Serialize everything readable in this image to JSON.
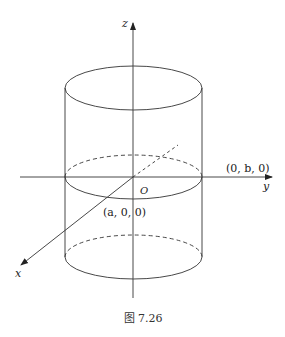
{
  "figure": {
    "caption": "图 7.26"
  },
  "axes": {
    "x_label": "x",
    "y_label": "y",
    "z_label": "z",
    "origin_label": "O"
  },
  "points": {
    "x_intercept": "(a, 0, 0)",
    "y_intercept": "(0, b, 0)"
  },
  "colors": {
    "stroke": "#333333",
    "background": "#ffffff"
  }
}
